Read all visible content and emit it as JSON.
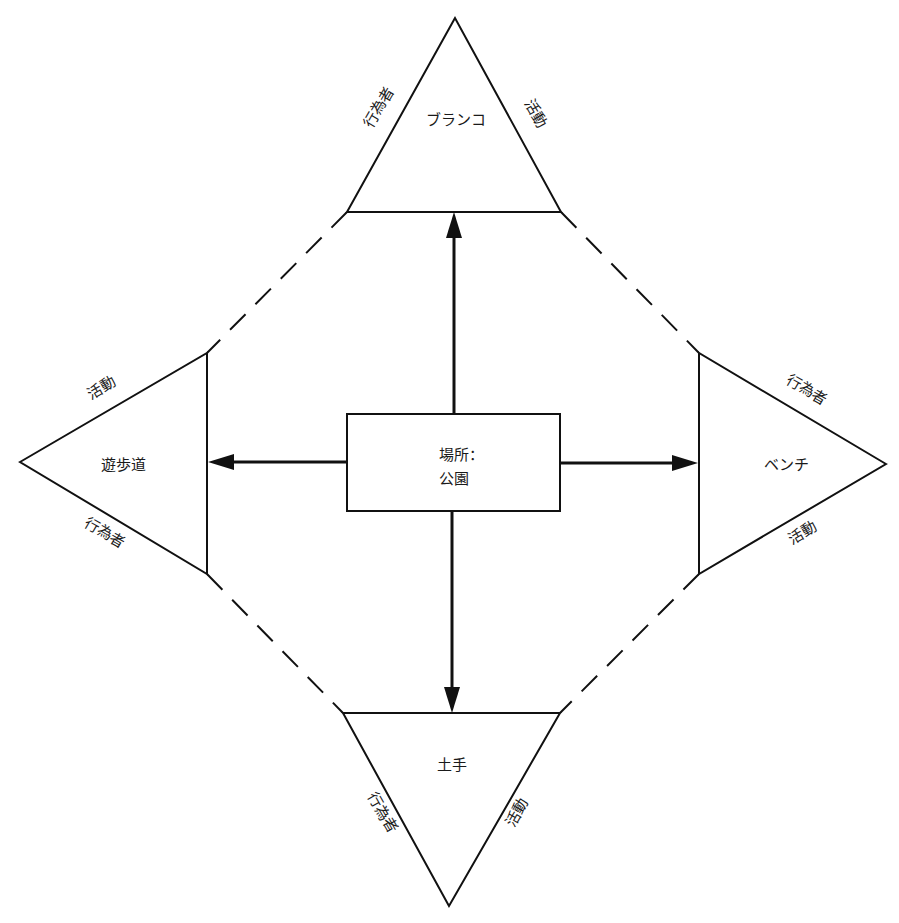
{
  "center": {
    "line1": "場所：",
    "line2": "公園"
  },
  "nodes": {
    "top": {
      "label": "ブランコ",
      "left_edge": "行為者",
      "right_edge": "活動"
    },
    "left": {
      "label": "遊歩道",
      "upper_edge": "活動",
      "lower_edge": "行為者"
    },
    "right": {
      "label": "ベンチ",
      "upper_edge": "行為者",
      "lower_edge": "活動"
    },
    "bottom": {
      "label": "土手",
      "left_edge": "行為者",
      "right_edge": "活動"
    }
  },
  "colors": {
    "stroke": "#111111",
    "text": "#1a1a1a",
    "background": "#ffffff"
  }
}
